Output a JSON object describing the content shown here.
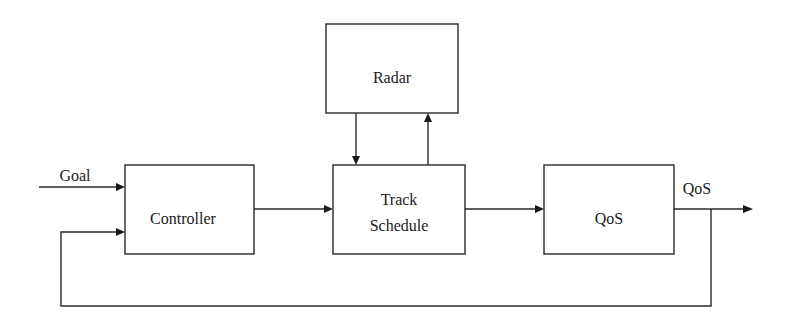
{
  "diagram": {
    "type": "block-diagram",
    "blocks": {
      "radar": {
        "label": "Radar"
      },
      "controller": {
        "label": "Controller"
      },
      "track_schedule": {
        "line1": "Track",
        "line2": "Schedule"
      },
      "qos": {
        "label": "QoS"
      }
    },
    "signals": {
      "goal": "Goal",
      "output": "QoS"
    },
    "connections": [
      {
        "from": "Goal",
        "to": "Controller"
      },
      {
        "from": "Controller",
        "to": "Track Schedule"
      },
      {
        "from": "Radar",
        "to": "Track Schedule"
      },
      {
        "from": "Track Schedule",
        "to": "Radar"
      },
      {
        "from": "Track Schedule",
        "to": "QoS"
      },
      {
        "from": "QoS",
        "to": "QoS (output)"
      },
      {
        "from": "QoS (output)",
        "to": "Controller",
        "kind": "feedback"
      }
    ]
  }
}
